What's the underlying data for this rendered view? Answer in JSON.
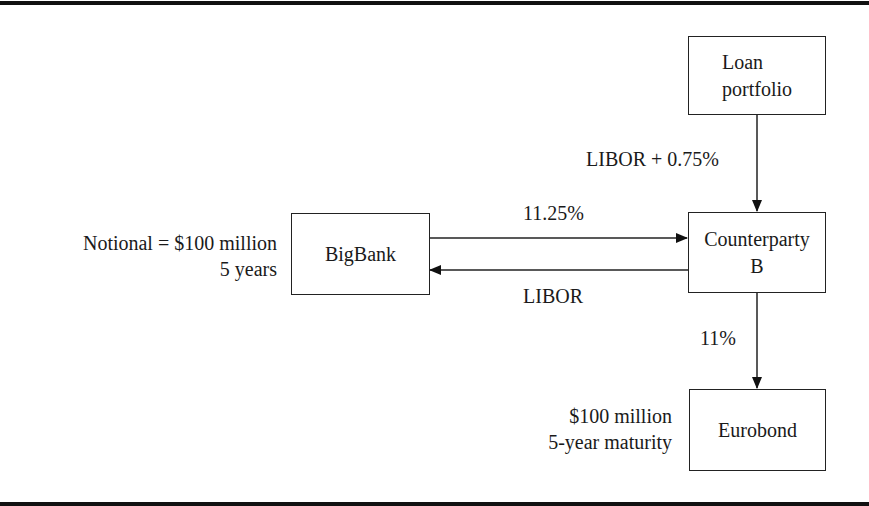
{
  "nodes": {
    "loan_portfolio": {
      "line1": "Loan",
      "line2": "portfolio"
    },
    "bigbank": {
      "label": "BigBank"
    },
    "counterparty_b": {
      "line1": "Counterparty",
      "line2": "B"
    },
    "eurobond": {
      "label": "Eurobond"
    }
  },
  "annotations": {
    "bigbank_terms": {
      "line1": "Notional = $100 million",
      "line2": "5 years"
    },
    "eurobond_terms": {
      "line1": "$100 million",
      "line2": "5-year maturity"
    }
  },
  "flows": {
    "loan_to_counterparty": "LIBOR + 0.75%",
    "bigbank_to_counterparty": "11.25%",
    "counterparty_to_bigbank": "LIBOR",
    "counterparty_to_eurobond": "11%"
  }
}
